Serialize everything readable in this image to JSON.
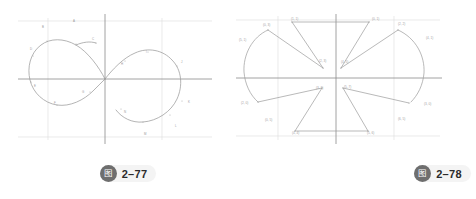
{
  "document": {
    "background_color": "#ffffff",
    "page_type": "textbook-figure-pair"
  },
  "figures": [
    {
      "id": "fig-2-77",
      "caption": {
        "badge_glyph": "图",
        "badge_name": "figure-badge",
        "number": "2–77",
        "badge_color": "#6e6e6e",
        "pill_color": "#f4f4f4",
        "text_color": "#2b2b2b"
      },
      "axes": {
        "axis_color": "#8a8a8a",
        "grid_color": "#dcdcdc",
        "curve_color": "#9a9a9a",
        "origin": [
          105,
          79
        ],
        "x_axis_y": 79,
        "y_axis_x": 105,
        "grid_vertical_x": [
          48,
          105,
          162
        ],
        "grid_horizontal_y": [
          21,
          79,
          137
        ],
        "bounds": {
          "x": [
            18,
            212
          ],
          "y": [
            18,
            140
          ]
        }
      },
      "point_labels": [
        {
          "text": "A",
          "x": 73,
          "y": 22
        },
        {
          "text": "B",
          "x": 42,
          "y": 28
        },
        {
          "text": "C",
          "x": 92,
          "y": 40
        },
        {
          "text": "D",
          "x": 30,
          "y": 50
        },
        {
          "text": "E",
          "x": 34,
          "y": 87
        },
        {
          "text": "F",
          "x": 54,
          "y": 104
        },
        {
          "text": "G",
          "x": 82,
          "y": 93
        },
        {
          "text": "H",
          "x": 121,
          "y": 65
        },
        {
          "text": "I",
          "x": 146,
          "y": 53
        },
        {
          "text": "J",
          "x": 181,
          "y": 63
        },
        {
          "text": "K",
          "x": 188,
          "y": 103
        },
        {
          "text": "L",
          "x": 175,
          "y": 127
        },
        {
          "text": "M",
          "x": 144,
          "y": 135
        },
        {
          "text": "N",
          "x": 124,
          "y": 113
        }
      ]
    },
    {
      "id": "fig-2-78",
      "caption": {
        "badge_glyph": "图",
        "badge_name": "figure-badge",
        "number": "2–78",
        "badge_color": "#6e6e6e",
        "pill_color": "#f4f4f4",
        "text_color": "#2b2b2b"
      },
      "axes": {
        "axis_color": "#8a8a8a",
        "grid_color": "#dcdcdc",
        "curve_color": "#9a9a9a",
        "origin": [
          108,
          78
        ],
        "x_axis_y": 78,
        "y_axis_x": 108,
        "grid_vertical_x": [
          50,
          108,
          166
        ],
        "grid_horizontal_y": [
          20,
          78,
          136
        ],
        "bounds": {
          "x": [
            8,
            212
          ],
          "y": [
            16,
            140
          ]
        }
      },
      "point_labels": [
        {
          "text": "(1, 1)",
          "x": 63,
          "y": 20
        },
        {
          "text": "(0, 1)",
          "x": 144,
          "y": 20
        },
        {
          "text": "(2, 3)",
          "x": 91,
          "y": 62
        },
        {
          "text": "(4, 5)",
          "x": 113,
          "y": 63
        },
        {
          "text": "(2, 2)",
          "x": 170,
          "y": 25
        },
        {
          "text": "(0, 3)",
          "x": 35,
          "y": 26
        },
        {
          "text": "(4, 1)",
          "x": 198,
          "y": 39
        },
        {
          "text": "(5, 1)",
          "x": 11,
          "y": 41
        },
        {
          "text": "(3, 1)",
          "x": 88,
          "y": 89
        },
        {
          "text": "(5, 7)",
          "x": 116,
          "y": 88
        },
        {
          "text": "(2, 0)",
          "x": 13,
          "y": 104
        },
        {
          "text": "(3, 0)",
          "x": 196,
          "y": 105
        },
        {
          "text": "(0, 5)",
          "x": 37,
          "y": 121
        },
        {
          "text": "(6, 5)",
          "x": 170,
          "y": 120
        },
        {
          "text": "(4, 4)",
          "x": 64,
          "y": 134
        },
        {
          "text": "(5, 6)",
          "x": 139,
          "y": 134
        }
      ]
    }
  ]
}
